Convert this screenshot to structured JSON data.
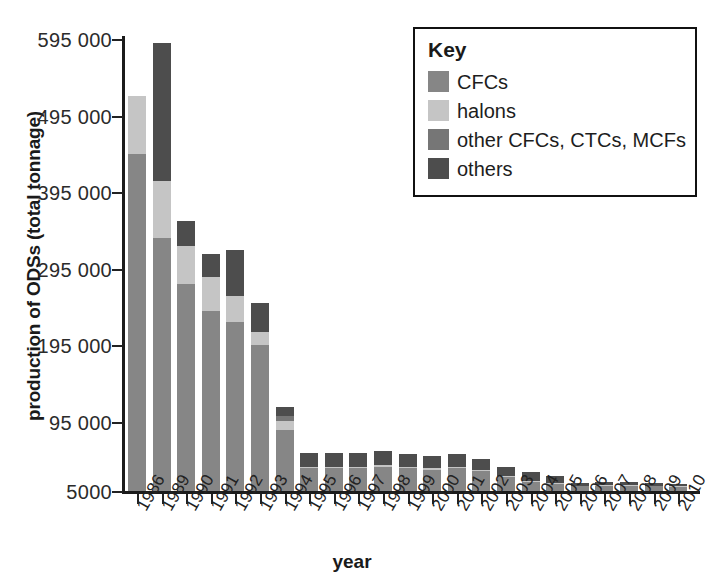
{
  "chart_data": {
    "type": "bar",
    "title": "",
    "subtitle": "",
    "xlabel": "year",
    "ylabel": "production of ODSs (total tonnage)",
    "stacked": true,
    "grid": false,
    "legend_position": "top-right",
    "legend_title": "Key",
    "ylim": [
      5000,
      595000
    ],
    "ytick_labels": [
      "595 000",
      "495 000",
      "395 000",
      "295 000",
      "195 000",
      "95 000",
      "5000"
    ],
    "ytick_values": [
      595000,
      495000,
      395000,
      295000,
      195000,
      95000,
      5000
    ],
    "categories": [
      "1986",
      "1989",
      "1990",
      "1991",
      "1992",
      "1993",
      "1994",
      "1995",
      "1996",
      "1997",
      "1998",
      "1999",
      "2000",
      "2001",
      "2002",
      "2003",
      "2004",
      "2005",
      "2006",
      "2007",
      "2008",
      "2009",
      "2010"
    ],
    "series": [
      {
        "name": "CFCs",
        "color": "#868686",
        "values": [
          440000,
          330000,
          270000,
          235000,
          220000,
          190000,
          80000,
          30000,
          30000,
          30000,
          32000,
          30000,
          28000,
          30000,
          26000,
          18000,
          12000,
          9000,
          6000,
          7000,
          7000,
          6000,
          5500
        ]
      },
      {
        "name": "halons",
        "color": "#c5c5c5",
        "values": [
          75000,
          75000,
          50000,
          45000,
          35000,
          18000,
          12000,
          2000,
          2000,
          2000,
          2000,
          2000,
          2000,
          2000,
          2000,
          1500,
          1500,
          1000,
          800,
          800,
          800,
          700,
          600
        ]
      },
      {
        "name": "other CFCs, CTCs, MCFs",
        "color": "#767676",
        "values": [
          0,
          0,
          0,
          0,
          0,
          0,
          6000,
          0,
          0,
          0,
          0,
          0,
          0,
          0,
          0,
          0,
          0,
          0,
          0,
          0,
          0,
          0,
          0
        ]
      },
      {
        "name": "others",
        "color": "#4d4d4d",
        "values": [
          0,
          180000,
          33000,
          30000,
          60000,
          38000,
          12000,
          18000,
          18000,
          18000,
          18000,
          16000,
          16000,
          16000,
          14000,
          12000,
          11000,
          10000,
          4000,
          4000,
          4000,
          3500,
          3000
        ]
      }
    ]
  },
  "legend": {
    "title": "Key",
    "entries": [
      {
        "label": "CFCs",
        "color": "#868686"
      },
      {
        "label": "halons",
        "color": "#c5c5c5"
      },
      {
        "label": "other CFCs, CTCs, MCFs",
        "color": "#767676"
      },
      {
        "label": "others",
        "color": "#4d4d4d"
      }
    ]
  },
  "axes": {
    "x_title": "year",
    "y_title": "production of ODSs (total tonnage)"
  }
}
